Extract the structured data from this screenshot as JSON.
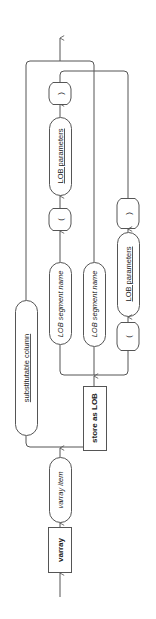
{
  "diagram": {
    "type": "railroad-syntax-diagram",
    "orientation": "rotated-90-ccw (flow bottom to top)",
    "nodes": {
      "varray_keyword": "varray",
      "varray_item": "varray_item",
      "substitutable_column": "substitutable_column",
      "store_as_lob": "store as LOB",
      "lob_segment_name_1": "LOB_segment_name",
      "lob_segment_name_2": "LOB_segment_name",
      "lob_parameters_1": "LOB_parameters",
      "lob_parameters_2": "LOB_parameters",
      "paren_open_1": "(",
      "paren_close_1": ")",
      "paren_open_2": "(",
      "paren_close_2": ")"
    },
    "display": {
      "varray_keyword": "varray",
      "varray_item": "varray item",
      "substitutable_column": "substitutable column",
      "store_as_lob": "store as LOB",
      "lob_segment_name": "LOB segment name",
      "lob_parameters": "LOB parameters",
      "paren_open": "(",
      "paren_close": ")"
    },
    "colors": {
      "line": "#555555",
      "text": "#222222",
      "background": "#ffffff"
    }
  }
}
